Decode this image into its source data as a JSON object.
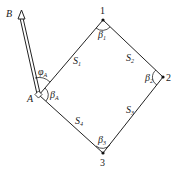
{
  "diagram": {
    "type": "traverse-network",
    "colors": {
      "line": "#222222",
      "background": "#ffffff"
    },
    "points": {
      "B": {
        "label": "B",
        "role": "reference direction (arrow)"
      },
      "A": {
        "label": "A",
        "role": "known station"
      },
      "p1": {
        "label": "1"
      },
      "p2": {
        "label": "2"
      },
      "p3": {
        "label": "3"
      }
    },
    "sides": [
      {
        "from": "A",
        "to": "1",
        "label": "S",
        "sub": "1"
      },
      {
        "from": "1",
        "to": "2",
        "label": "S",
        "sub": "2"
      },
      {
        "from": "2",
        "to": "3",
        "label": "S",
        "sub": "3"
      },
      {
        "from": "3",
        "to": "A",
        "label": "S",
        "sub": "4"
      }
    ],
    "angles": [
      {
        "at": "1",
        "label": "β",
        "sub": "1"
      },
      {
        "at": "2",
        "label": "β",
        "sub": "2"
      },
      {
        "at": "3",
        "label": "β",
        "sub": "3"
      },
      {
        "at": "A",
        "label": "β",
        "sub": "A"
      },
      {
        "at": "A",
        "between": "AB and AS1",
        "label": "φ",
        "sub": "A"
      }
    ]
  }
}
